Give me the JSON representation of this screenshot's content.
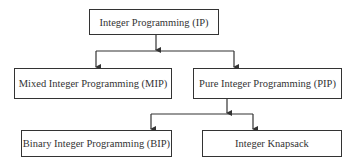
{
  "diagram": {
    "type": "tree",
    "nodes": {
      "root": {
        "label": "Integer Programming (IP)"
      },
      "mip": {
        "label": "Mixed Integer Programming (MIP)"
      },
      "pip": {
        "label": "Pure Integer Programming (PIP)"
      },
      "bip": {
        "label": "Binary Integer Programming (BIP)"
      },
      "knapsack": {
        "label": "Integer Knapsack"
      }
    },
    "edges": [
      {
        "from": "root",
        "to": "mip"
      },
      {
        "from": "root",
        "to": "pip"
      },
      {
        "from": "pip",
        "to": "bip"
      },
      {
        "from": "pip",
        "to": "knapsack"
      }
    ],
    "colors": {
      "stroke": "#333333",
      "text": "#333333",
      "background": "#ffffff"
    }
  }
}
